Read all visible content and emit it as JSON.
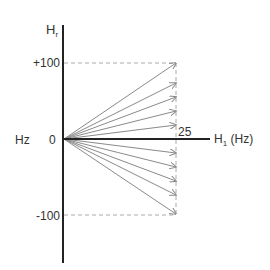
{
  "diagram": {
    "y_axis_label": "H",
    "y_axis_sub": "r",
    "x_axis_label": "H",
    "x_axis_sub": "1",
    "x_axis_unit": "(Hz)",
    "left_label": "Hz",
    "origin_label": "0",
    "top_tick": "+100",
    "bottom_tick": "-100",
    "x_tick": "25",
    "arrow_count": 10,
    "arrow_endpoints_y": [
      -100,
      -72,
      -54,
      -36,
      -18,
      18,
      36,
      54,
      72,
      100
    ],
    "arrow_endpoint_x": 25,
    "colors": {
      "axis": "#222222",
      "arrow": "#8a8a8a",
      "dashed": "#aaaaaa",
      "text": "#333333"
    }
  }
}
